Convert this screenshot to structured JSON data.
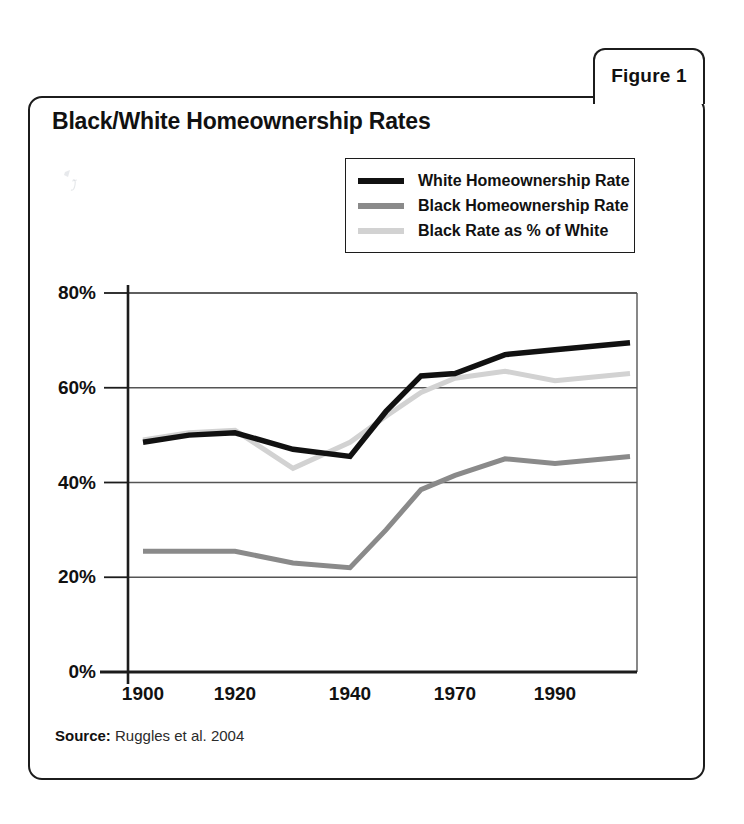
{
  "figure": {
    "tab_label": "Figure 1",
    "title": "Black/White Homeownership Rates",
    "source_label": "Source:",
    "source_text": " Ruggles et al. 2004"
  },
  "colors": {
    "white_rate": "#111111",
    "black_rate": "#8a8a8a",
    "ratio": "#d2d2d2",
    "axis": "#1c1c1c",
    "grid": "#555555",
    "frame": "#1c1c1c",
    "background": "#ffffff"
  },
  "chart_data": {
    "type": "line",
    "title": "Black/White Homeownership Rates",
    "xlabel": "",
    "ylabel": "",
    "ylim": [
      0,
      80
    ],
    "ytick_labels": [
      "80%",
      "60%",
      "40%",
      "20%",
      "0%"
    ],
    "ytick_values": [
      80,
      60,
      40,
      20,
      0
    ],
    "xtick_labels": [
      "1900",
      "1920",
      "1940",
      "1970",
      "1990"
    ],
    "xtick_values": [
      1900,
      1920,
      1940,
      1970,
      1990
    ],
    "x": [
      1900,
      1910,
      1920,
      1930,
      1940,
      1950,
      1960,
      1970,
      1980,
      1990,
      2000
    ],
    "grid": "horizontal",
    "legend_position": "top-right",
    "series": [
      {
        "name": "White Homeownership Rate",
        "color": "#111111",
        "values": [
          48.5,
          50.0,
          50.5,
          47.0,
          45.5,
          55.0,
          62.5,
          63.0,
          67.0,
          68.0,
          69.5
        ]
      },
      {
        "name": "Black Homeownership Rate",
        "color": "#8a8a8a",
        "values": [
          25.5,
          25.5,
          25.5,
          23.0,
          22.0,
          30.0,
          38.5,
          41.5,
          45.0,
          44.0,
          45.5
        ]
      },
      {
        "name": "Black Rate as % of White",
        "color": "#d2d2d2",
        "values": [
          49.0,
          50.5,
          51.0,
          43.0,
          48.5,
          54.0,
          59.0,
          62.0,
          63.5,
          61.5,
          63.0
        ]
      }
    ]
  },
  "legend": {
    "items": [
      {
        "label": "White Homeownership Rate",
        "color": "#111111"
      },
      {
        "label": "Black Homeownership Rate",
        "color": "#8a8a8a"
      },
      {
        "label": "Black Rate as % of White",
        "color": "#d2d2d2"
      }
    ]
  }
}
